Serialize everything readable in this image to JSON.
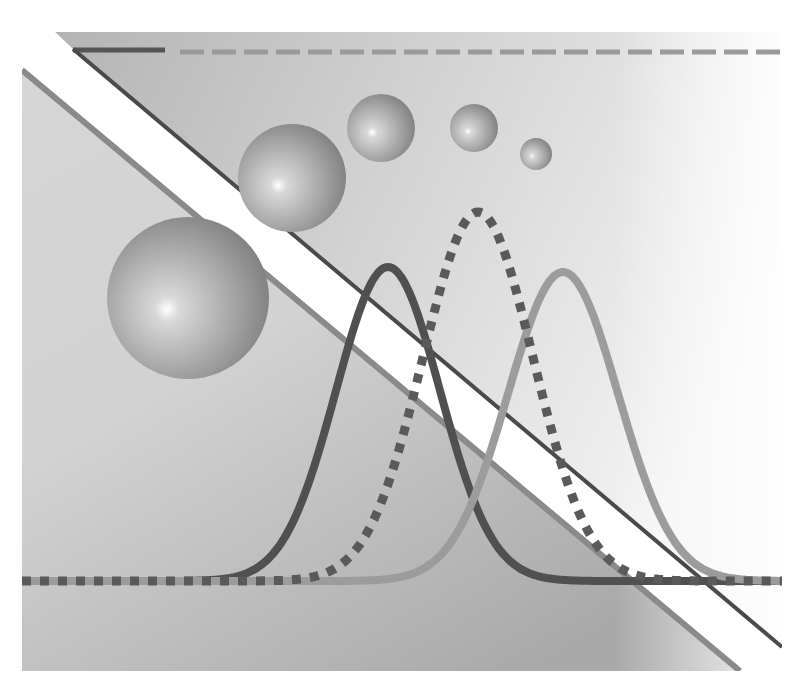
{
  "canvas": {
    "width": 811,
    "height": 683,
    "background": "#ffffff"
  },
  "panel": {
    "x": 22,
    "y": 32,
    "width": 760,
    "height": 639,
    "gradient_left": "#cfcfcf",
    "gradient_mid": "#dedede",
    "gradient_right": "#ffffff"
  },
  "upper_region": {
    "points": [
      [
        55,
        32
      ],
      [
        782,
        32
      ],
      [
        782,
        647
      ],
      [
        73,
        49
      ]
    ],
    "gradient_start": "#b4b4b4",
    "gradient_end": "#f4f4f4"
  },
  "lower_region": {
    "points": [
      [
        22,
        70
      ],
      [
        740,
        671
      ],
      [
        22,
        671
      ]
    ],
    "gradient_start": "#d6d6d6",
    "gradient_end": "#a9a9a9"
  },
  "white_band": {
    "points": [
      [
        22,
        32
      ],
      [
        55,
        32
      ],
      [
        73,
        49
      ],
      [
        782,
        647
      ],
      [
        782,
        671
      ],
      [
        740,
        671
      ],
      [
        22,
        70
      ]
    ],
    "color": "#ffffff"
  },
  "lines": {
    "dark_diagonal": {
      "x1": 73,
      "y1": 49,
      "x2": 782,
      "y2": 647,
      "color": "#4a4a4a",
      "width": 4
    },
    "medium_diagonal": {
      "x1": 22,
      "y1": 70,
      "x2": 740,
      "y2": 671,
      "color": "#8a8a8a",
      "width": 6
    },
    "top_solid": {
      "x1": 73,
      "y1": 50,
      "x2": 165,
      "y2": 50,
      "color": "#555555",
      "width": 5
    },
    "top_dashed": {
      "x1": 180,
      "y1": 52,
      "x2": 782,
      "y2": 52,
      "color": "#9a9a9a",
      "width": 5,
      "dash": "24,8"
    }
  },
  "spheres": [
    {
      "cx": 188,
      "cy": 298,
      "r": 81
    },
    {
      "cx": 292,
      "cy": 178,
      "r": 54
    },
    {
      "cx": 381,
      "cy": 128,
      "r": 34
    },
    {
      "cx": 474,
      "cy": 128,
      "r": 24
    },
    {
      "cx": 536,
      "cy": 154,
      "r": 16
    }
  ],
  "chart_data": {
    "type": "line",
    "title": "",
    "baseline_y": 581,
    "x_range": [
      22,
      782
    ],
    "series": [
      {
        "name": "dark-curve",
        "peak_x": 388,
        "peak_y": 267,
        "sigma": 52,
        "color": "#505050",
        "width": 8,
        "style": "solid"
      },
      {
        "name": "dotted-curve",
        "peak_x": 478,
        "peak_y": 212,
        "sigma": 55,
        "color": "#5a5a5a",
        "width": 9,
        "style": "dotted"
      },
      {
        "name": "light-curve",
        "peak_x": 563,
        "peak_y": 272,
        "sigma": 55,
        "color": "#9c9c9c",
        "width": 8,
        "style": "solid"
      }
    ]
  }
}
